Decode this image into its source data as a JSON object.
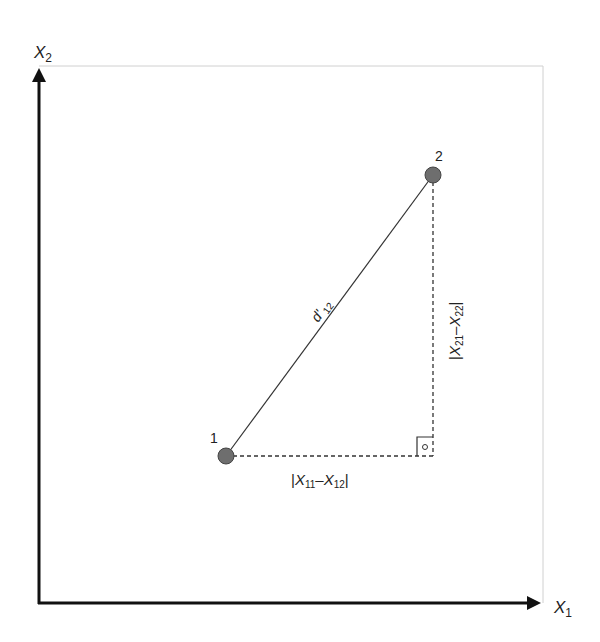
{
  "axes": {
    "y_label": "X",
    "y_label_sub": "2",
    "x_label": "X",
    "x_label_sub": "1"
  },
  "points": [
    {
      "label": "1",
      "x": 226,
      "y": 456
    },
    {
      "label": "2",
      "x": 433,
      "y": 175
    }
  ],
  "distance_label": {
    "main": "d'",
    "sub": "12"
  },
  "horizontal_label": {
    "bar_open": "|",
    "a": "X",
    "a_sub": "11",
    "dash": "–",
    "b": "X",
    "b_sub": "12",
    "bar_close": "|"
  },
  "vertical_label": {
    "bar_open": "|",
    "a": "X",
    "a_sub": "21",
    "dash": "–",
    "b": "X",
    "b_sub": "22",
    "bar_close": "|"
  },
  "right_angle_marker": "°",
  "colors": {
    "axis": "#111111",
    "frame": "#d0d0d0",
    "point_fill": "#6e6e6e",
    "point_stroke": "#444444",
    "line": "#333333"
  }
}
